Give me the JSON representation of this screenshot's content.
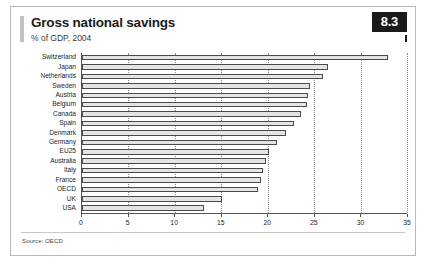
{
  "figure": {
    "title": "Gross national savings",
    "subtitle": "% of GDP, 2004",
    "badge": "8.3",
    "source": "Source: OECD",
    "accent_color": "#1a1a1a",
    "bar_fill": "#e4e4e4",
    "bar_stroke": "#4a4a4a"
  },
  "chart_data": {
    "type": "bar",
    "orientation": "horizontal",
    "title": "Gross national savings",
    "subtitle": "% of GDP, 2004",
    "xlabel": "",
    "ylabel": "",
    "xlim": [
      0,
      35
    ],
    "xticks": [
      0,
      5,
      10,
      15,
      20,
      25,
      30,
      35
    ],
    "grid": true,
    "legend": false,
    "categories": [
      "Switzerland",
      "Japan",
      "Netherlands",
      "Sweden",
      "Austria",
      "Belgium",
      "Canada",
      "Spain",
      "Denmark",
      "Germany",
      "EU25",
      "Australia",
      "Italy",
      "France",
      "OECD",
      "UK",
      "USA"
    ],
    "values": [
      33.0,
      26.5,
      26.0,
      24.5,
      24.3,
      24.2,
      23.6,
      22.8,
      22.0,
      21.0,
      20.1,
      19.8,
      19.5,
      19.3,
      19.0,
      15.1,
      13.1
    ],
    "source": "Source: OECD"
  }
}
